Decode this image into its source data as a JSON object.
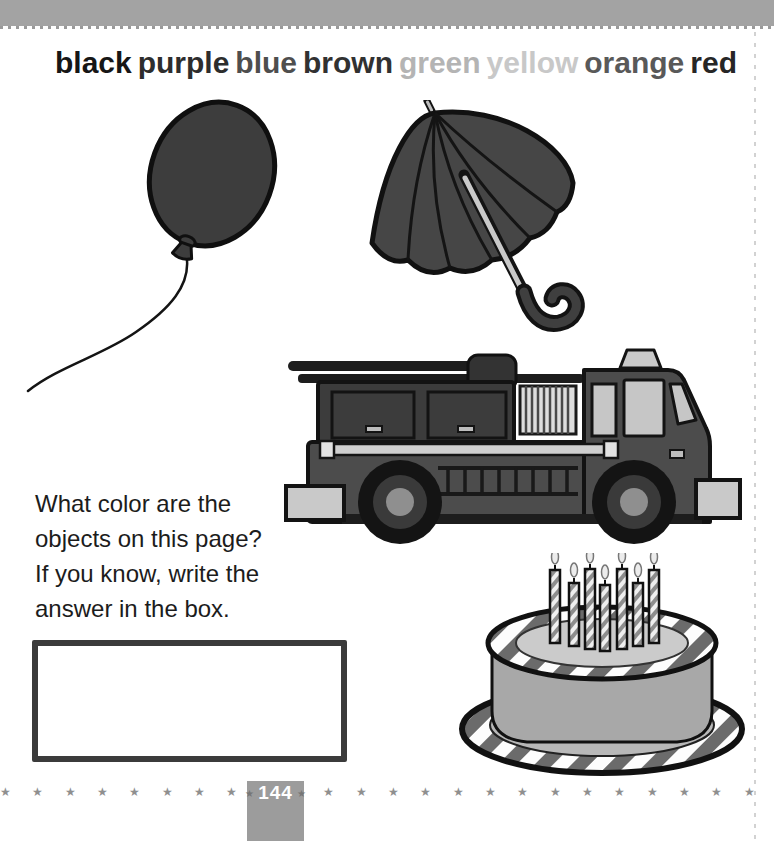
{
  "page": {
    "number": "144",
    "star_char": "★",
    "star_count": 48,
    "badge_bg": "#9c9c9c",
    "band_color": "#a3a3a3"
  },
  "word_bank": [
    {
      "label": "black",
      "ink": "#161616"
    },
    {
      "label": "purple",
      "ink": "#2d2d2d"
    },
    {
      "label": "blue",
      "ink": "#4e4e4e"
    },
    {
      "label": "brown",
      "ink": "#313131"
    },
    {
      "label": "green",
      "ink": "#b4b4b4"
    },
    {
      "label": "yellow",
      "ink": "#c8c8c8"
    },
    {
      "label": "orange",
      "ink": "#595959"
    },
    {
      "label": "red",
      "ink": "#262626"
    }
  ],
  "question": {
    "text": "What color are the\nobjects on this page?\nIf you know, write the\nanswer in the box."
  },
  "answer_box": {
    "value": ""
  },
  "illustrations": {
    "balloon": "balloon on a string",
    "umbrella": "open umbrella",
    "fire_truck": "fire truck",
    "cake": "birthday cake with 7 candles",
    "cake_candles": 7
  }
}
